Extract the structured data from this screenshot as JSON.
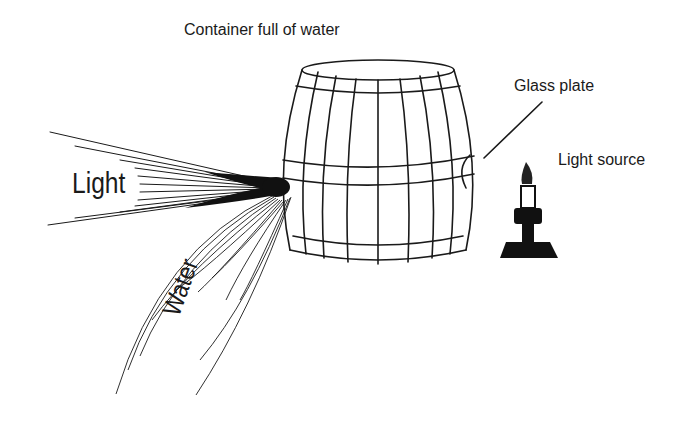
{
  "diagram": {
    "title": "Container full of water",
    "labels": {
      "glass_plate": "Glass plate",
      "light_source": "Light source",
      "light": "Light",
      "water": "Water"
    },
    "elements": [
      {
        "name": "barrel",
        "description": "Wooden barrel container full of water"
      },
      {
        "name": "glass-plate",
        "description": "Glass plate window on right side of barrel"
      },
      {
        "name": "candle",
        "description": "Candle light source on stand"
      },
      {
        "name": "light-rays",
        "description": "Rays of light emerging from spout"
      },
      {
        "name": "water-stream",
        "description": "Curved stream of water flowing from spout"
      }
    ],
    "colors": {
      "ink": "#1a1a1a",
      "background": "#ffffff"
    }
  }
}
